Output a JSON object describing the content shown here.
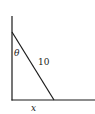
{
  "diagram": {
    "labels": {
      "angle": "θ",
      "hypotenuse": "10",
      "base": "x"
    },
    "geometry": {
      "wall": {
        "x": 12,
        "y_top": 16,
        "y_bottom": 100
      },
      "ground": {
        "y": 100,
        "x_left": 12,
        "x_right": 95
      },
      "hypotenuse": {
        "from": [
          12,
          32
        ],
        "to": [
          54,
          100
        ]
      }
    },
    "colors": {
      "line": "#1a1a1a",
      "background": "#ffffff"
    }
  }
}
